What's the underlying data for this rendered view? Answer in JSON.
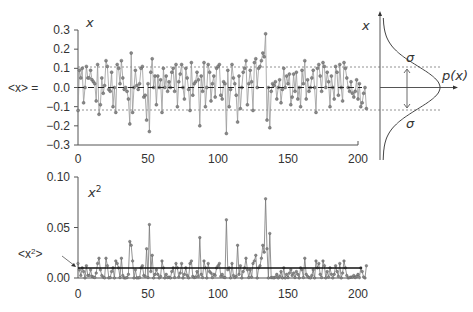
{
  "chart_data": [
    {
      "type": "line",
      "title": "",
      "series_label": "x",
      "ylabel_left": "<x> =",
      "xlim": [
        0,
        200
      ],
      "ylim": [
        -0.3,
        0.3
      ],
      "xticks": [
        "0",
        "50",
        "100",
        "150",
        "200"
      ],
      "yticks": [
        "0.3",
        "0.2",
        "0.1",
        "0.0",
        "−0.1",
        "−0.2",
        "−0.3"
      ],
      "mean": 0.0,
      "sigma_upper": 0.1,
      "sigma_lower": -0.12,
      "values": [
        -0.12,
        0.09,
        0.05,
        0.1,
        -0.08,
        0.0,
        0.11,
        0.05,
        0.05,
        0.09,
        0.04,
        0.03,
        0.02,
        -0.07,
        0.12,
        -0.14,
        -0.09,
        0.05,
        -0.03,
        0.01,
        0.14,
        0.11,
        -0.01,
        -0.02,
        0.08,
        -0.1,
        0.0,
        -0.13,
        0.12,
        0.1,
        0.02,
        0.14,
        0.05,
        -0.01,
        0.0,
        -0.02,
        -0.06,
        -0.19,
        0.18,
        -0.13,
        0.0,
        0.09,
        0.01,
        -0.01,
        0.02,
        0.1,
        0.11,
        -0.05,
        -0.04,
        -0.17,
        0.02,
        -0.23,
        0.08,
        0.15,
        0.0,
        0.06,
        -0.09,
        0.06,
        0.0,
        0.04,
        -0.13,
        0.1,
        0.0,
        0.06,
        -0.02,
        0.03,
        0.0,
        0.08,
        0.1,
        -0.02,
        0.12,
        -0.1,
        0.03,
        0.07,
        0.12,
        0.0,
        -0.06,
        0.1,
        0.05,
        -0.01,
        -0.12,
        0.13,
        -0.04,
        0.02,
        0.03,
        0.08,
        0.04,
        -0.2,
        0.06,
        -0.02,
        0.13,
        -0.1,
        0.0,
        0.12,
        0.08,
        -0.07,
        0.02,
        0.06,
        -0.05,
        0.1,
        0.11,
        0.12,
        -0.04,
        -0.06,
        0.03,
        0.02,
        -0.24,
        0.09,
        -0.1,
        -0.01,
        0.12,
        0.05,
        0.02,
        -0.04,
        -0.18,
        0.06,
        -0.11,
        0.0,
        0.08,
        0.1,
        0.14,
        -0.09,
        0.02,
        0.09,
        0.03,
        -0.12,
        0.13,
        0.15,
        0.0,
        0.1,
        0.11,
        0.14,
        0.18,
        0.16,
        0.28,
        -0.17,
        0.0,
        -0.21,
        -0.02,
        0.02,
        0.01,
        0.03,
        -0.06,
        0.0,
        0.04,
        -0.08,
        -0.01,
        0.1,
        0.0,
        0.06,
        0.02,
        0.07,
        -0.09,
        -0.05,
        0.07,
        -0.02,
        0.08,
        -0.06,
        0.0,
        -0.1,
        0.09,
        0.02,
        0.14,
        -0.06,
        0.04,
        -0.02,
        0.0,
        0.05,
        0.09,
        0.0,
        -0.13,
        0.1,
        0.12,
        0.06,
        -0.02,
        0.13,
        0.11,
        0.0,
        0.08,
        0.03,
        -0.1,
        0.06,
        0.0,
        -0.06,
        0.11,
        0.08,
        -0.04,
        0.12,
        0.0,
        -0.07,
        0.13,
        0.1,
        0.05,
        0.0,
        -0.02,
        0.03,
        -0.03,
        -0.05,
        -0.02,
        0.04,
        -0.06,
        0.02,
        -0.1,
        -0.08,
        -0.03,
        0.0,
        -0.11
      ]
    },
    {
      "type": "line",
      "title": "",
      "series_label": "x²",
      "ylabel_left": "<x²>",
      "xlim": [
        0,
        200
      ],
      "ylim": [
        0,
        0.1
      ],
      "xticks": [
        "0",
        "50",
        "100",
        "150",
        "200"
      ],
      "yticks": [
        "0.10",
        "0.05",
        "0.00"
      ],
      "mean": 0.01,
      "values_note": "squares of top series"
    },
    {
      "type": "line",
      "title": "Gaussian distribution",
      "xlabel": "p(x)",
      "ylabel": "x",
      "annotations": [
        "σ",
        "σ"
      ]
    }
  ],
  "labels": {
    "top_x": "x",
    "mean_x": "<x> =",
    "bottom_x2_base": "x",
    "bottom_x2_sup": "2",
    "mean_x2_left": "<x",
    "mean_x2_sup": "2",
    "mean_x2_right": ">",
    "dist_x": "x",
    "dist_p": "p(x)",
    "sigma": "σ"
  }
}
